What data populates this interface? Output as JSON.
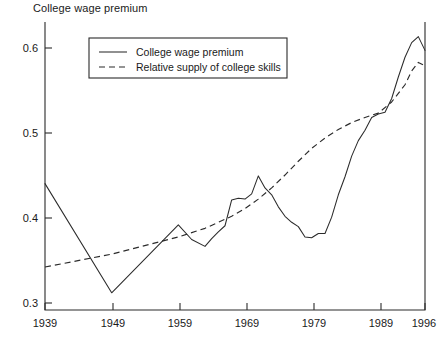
{
  "figure": {
    "title": "College wage premium",
    "background_color": "#ffffff",
    "ink_color": "#2b2b2b"
  },
  "legend": {
    "position": "top-left-inside",
    "entries": [
      {
        "label": "College wage premium",
        "style": "solid"
      },
      {
        "label": "Relative supply of college skills",
        "style": "dashed"
      }
    ]
  },
  "axes": {
    "y_tick_labels": [
      "0.6",
      "0.5",
      "0.4",
      "0.3"
    ],
    "x_tick_labels": [
      "1939",
      "1949",
      "1959",
      "1969",
      "1979",
      "1989",
      "1996"
    ]
  },
  "chart_data": {
    "type": "line",
    "title": "College wage premium",
    "xlabel": "",
    "ylabel": "",
    "xlim": [
      1939,
      1996
    ],
    "ylim": [
      0.29,
      0.625
    ],
    "yticks": [
      0.3,
      0.4,
      0.5,
      0.6
    ],
    "xticks": [
      1939,
      1949,
      1959,
      1969,
      1979,
      1989,
      1996
    ],
    "grid": false,
    "legend_position": "upper left",
    "series": [
      {
        "name": "College wage premium",
        "style": "solid",
        "x": [
          1939,
          1949,
          1959,
          1961,
          1963,
          1964,
          1965,
          1966,
          1967,
          1968,
          1969,
          1970,
          1971,
          1972,
          1973,
          1974,
          1975,
          1976,
          1977,
          1978,
          1979,
          1980,
          1981,
          1982,
          1983,
          1984,
          1985,
          1986,
          1987,
          1988,
          1989,
          1990,
          1991,
          1992,
          1993,
          1994,
          1995,
          1996
        ],
        "y": [
          0.437,
          0.31,
          0.389,
          0.372,
          0.364,
          0.373,
          0.381,
          0.388,
          0.418,
          0.42,
          0.419,
          0.425,
          0.446,
          0.432,
          0.424,
          0.41,
          0.399,
          0.392,
          0.387,
          0.375,
          0.374,
          0.379,
          0.379,
          0.398,
          0.424,
          0.445,
          0.469,
          0.487,
          0.499,
          0.514,
          0.518,
          0.52,
          0.536,
          0.561,
          0.584,
          0.601,
          0.608,
          0.592
        ]
      },
      {
        "name": "Relative supply of college skills",
        "style": "dashed",
        "x": [
          1939,
          1949,
          1959,
          1963,
          1967,
          1969,
          1971,
          1973,
          1975,
          1977,
          1979,
          1981,
          1983,
          1985,
          1987,
          1989,
          1991,
          1993,
          1994,
          1995,
          1996
        ],
        "y": [
          0.34,
          0.355,
          0.375,
          0.385,
          0.399,
          0.408,
          0.419,
          0.432,
          0.447,
          0.463,
          0.478,
          0.49,
          0.5,
          0.508,
          0.514,
          0.519,
          0.532,
          0.552,
          0.568,
          0.578,
          0.574
        ]
      }
    ]
  }
}
